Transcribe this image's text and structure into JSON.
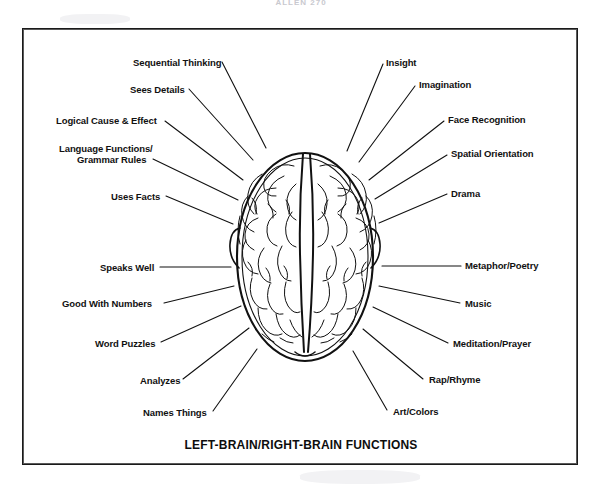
{
  "page": {
    "header_text": "ALLEN 270",
    "bottom_title": "LEFT-BRAIN/RIGHT-BRAIN FUNCTIONS",
    "ink_color": "#111111",
    "frame_color": "#1a1a1a",
    "background_color": "#ffffff"
  },
  "diagram": {
    "type": "labeled-illustration",
    "left_hemisphere": {
      "side": "left",
      "labels": [
        {
          "text": "Sequential Thinking",
          "x": 133,
          "y": 57,
          "anchor": "start",
          "line": {
            "x1": 222,
            "y1": 62,
            "x2": 266,
            "y2": 148
          }
        },
        {
          "text": "Sees Details",
          "x": 130,
          "y": 84,
          "anchor": "start",
          "line": {
            "x1": 189,
            "y1": 89,
            "x2": 253,
            "y2": 160
          }
        },
        {
          "text": "Logical Cause & Effect",
          "x": 56,
          "y": 115,
          "anchor": "start",
          "line": {
            "x1": 165,
            "y1": 120,
            "x2": 243,
            "y2": 178
          }
        },
        {
          "text": "Language Functions/",
          "x": 59,
          "y": 144,
          "anchor": "start",
          "line": null
        },
        {
          "text": "Grammar Rules",
          "x": 77,
          "y": 155,
          "anchor": "start",
          "line": {
            "x1": 153,
            "y1": 158,
            "x2": 238,
            "y2": 199
          }
        },
        {
          "text": "Uses Facts",
          "x": 111,
          "y": 192,
          "anchor": "start",
          "line": {
            "x1": 166,
            "y1": 196,
            "x2": 233,
            "y2": 223
          }
        },
        {
          "text": "Speaks Well",
          "x": 100,
          "y": 263,
          "anchor": "start",
          "line": {
            "x1": 162,
            "y1": 267,
            "x2": 231,
            "y2": 267
          }
        },
        {
          "text": "Good With Numbers",
          "x": 64,
          "y": 305,
          "anchor": "start",
          "line": {
            "x1": 166,
            "y1": 303,
            "x2": 234,
            "y2": 285
          }
        },
        {
          "text": "Word Puzzles",
          "x": 95,
          "y": 345,
          "anchor": "start",
          "line": {
            "x1": 162,
            "y1": 342,
            "x2": 240,
            "y2": 305
          }
        },
        {
          "text": "Analyzes",
          "x": 140,
          "y": 382,
          "anchor": "start",
          "line": {
            "x1": 184,
            "y1": 379,
            "x2": 248,
            "y2": 327
          }
        },
        {
          "text": "Names Things",
          "x": 143,
          "y": 414,
          "anchor": "start",
          "line": {
            "x1": 214,
            "y1": 411,
            "x2": 256,
            "y2": 348
          }
        }
      ]
    },
    "right_hemisphere": {
      "side": "right",
      "labels": [
        {
          "text": "Insight",
          "x": 385,
          "y": 57,
          "anchor": "start",
          "line": {
            "x1": 383,
            "y1": 63,
            "x2": 347,
            "y2": 150
          }
        },
        {
          "text": "Imagination",
          "x": 418,
          "y": 79,
          "anchor": "start",
          "line": {
            "x1": 415,
            "y1": 85,
            "x2": 359,
            "y2": 161
          }
        },
        {
          "text": "Face Recognition",
          "x": 447,
          "y": 115,
          "anchor": "start",
          "line": {
            "x1": 444,
            "y1": 120,
            "x2": 369,
            "y2": 179
          }
        },
        {
          "text": "Spatial Orientation",
          "x": 450,
          "y": 149,
          "anchor": "start",
          "line": {
            "x1": 447,
            "y1": 154,
            "x2": 375,
            "y2": 198
          }
        },
        {
          "text": "Drama",
          "x": 450,
          "y": 189,
          "anchor": "start",
          "line": {
            "x1": 447,
            "y1": 193,
            "x2": 379,
            "y2": 222
          }
        },
        {
          "text": "Metaphor/Poetry",
          "x": 464,
          "y": 263,
          "anchor": "start",
          "line": {
            "x1": 460,
            "y1": 266,
            "x2": 382,
            "y2": 266
          }
        },
        {
          "text": "Music",
          "x": 464,
          "y": 304,
          "anchor": "start",
          "line": {
            "x1": 460,
            "y1": 303,
            "x2": 378,
            "y2": 285
          }
        },
        {
          "text": "Meditation/Prayer",
          "x": 452,
          "y": 345,
          "anchor": "start",
          "line": {
            "x1": 448,
            "y1": 343,
            "x2": 372,
            "y2": 306
          }
        },
        {
          "text": "Rap/Rhyme",
          "x": 428,
          "y": 381,
          "anchor": "start",
          "line": {
            "x1": 424,
            "y1": 379,
            "x2": 362,
            "y2": 328
          }
        },
        {
          "text": "Art/Colors",
          "x": 392,
          "y": 413,
          "anchor": "start",
          "line": {
            "x1": 388,
            "y1": 410,
            "x2": 352,
            "y2": 350
          }
        }
      ]
    }
  }
}
